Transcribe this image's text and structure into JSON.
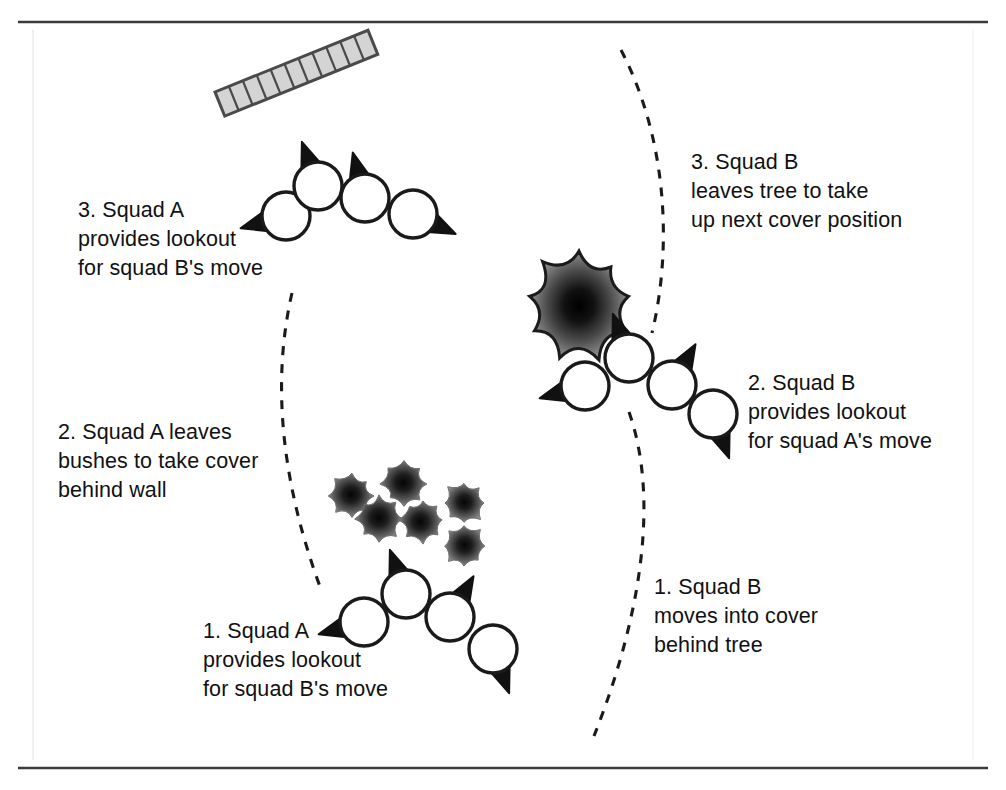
{
  "diagram": {
    "frame": {
      "top_rule": "horizontal-rule",
      "bottom_rule": "horizontal-rule",
      "rule_color": "#3a3a3a"
    },
    "colors": {
      "ink": "#111111",
      "outline": "#1a1a1a",
      "wall_fill": "#d4d4d4",
      "wall_edge": "#4a4a4a",
      "foliage_dark": "#0b0b0b",
      "foliage_mid": "#4f4f4f",
      "foliage_light": "#9a9a9a",
      "soldier_fill": "#ffffff",
      "path_dash": "#1a1a1a",
      "background": "#ffffff"
    },
    "captions": [
      {
        "id": "squad-a-step-3",
        "lines": [
          "3. Squad A",
          "provides lookout",
          "for squad B's move"
        ],
        "x": 78,
        "y": 196
      },
      {
        "id": "squad-a-step-2",
        "lines": [
          "2. Squad A leaves",
          "bushes to take cover",
          "behind wall"
        ],
        "x": 58,
        "y": 418
      },
      {
        "id": "squad-a-step-1",
        "lines": [
          "1. Squad A",
          "provides lookout",
          "for squad B's move"
        ],
        "x": 203,
        "y": 617
      },
      {
        "id": "squad-b-step-3",
        "lines": [
          "3. Squad B",
          "leaves tree to take",
          "up next cover position"
        ],
        "x": 691,
        "y": 148
      },
      {
        "id": "squad-b-step-2",
        "lines": [
          "2. Squad B",
          "provides lookout",
          "for squad A's move"
        ],
        "x": 748,
        "y": 369
      },
      {
        "id": "squad-b-step-1",
        "lines": [
          "1. Squad B",
          "moves into cover",
          "behind tree"
        ],
        "x": 654,
        "y": 573
      }
    ],
    "wall": {
      "id": "brick-wall",
      "label": "wall",
      "x": 215,
      "y": 92,
      "length": 165,
      "thickness": 26,
      "rotation_deg": -22,
      "brick_count": 11
    },
    "tree": {
      "id": "tree",
      "label": "tree",
      "cx": 579,
      "cy": 305,
      "radius": 54
    },
    "bushes": {
      "id": "bush-cluster",
      "label": "bushes",
      "radius": 22,
      "items": [
        {
          "cx": 352,
          "cy": 496
        },
        {
          "cx": 404,
          "cy": 484
        },
        {
          "cx": 379,
          "cy": 519
        },
        {
          "cx": 423,
          "cy": 520
        },
        {
          "cx": 464,
          "cy": 503
        },
        {
          "cx": 464,
          "cy": 546
        }
      ]
    },
    "soldier_groups": [
      {
        "id": "squad-a-upper",
        "squad": "A",
        "soldiers": [
          {
            "cx": 286,
            "cy": 216,
            "r": 24,
            "facing_deg": 255
          },
          {
            "cx": 318,
            "cy": 186,
            "r": 24,
            "facing_deg": 340
          },
          {
            "cx": 365,
            "cy": 198,
            "r": 24,
            "facing_deg": 345
          },
          {
            "cx": 413,
            "cy": 214,
            "r": 24,
            "facing_deg": 115
          }
        ]
      },
      {
        "id": "squad-a-lower",
        "squad": "A",
        "soldiers": [
          {
            "cx": 364,
            "cy": 622,
            "r": 24,
            "facing_deg": 255
          },
          {
            "cx": 406,
            "cy": 594,
            "r": 24,
            "facing_deg": 340
          },
          {
            "cx": 450,
            "cy": 617,
            "r": 24,
            "facing_deg": 30
          },
          {
            "cx": 493,
            "cy": 649,
            "r": 24,
            "facing_deg": 160
          }
        ]
      },
      {
        "id": "squad-b",
        "squad": "B",
        "soldiers": [
          {
            "cx": 585,
            "cy": 386,
            "r": 24,
            "facing_deg": 255
          },
          {
            "cx": 629,
            "cy": 358,
            "r": 24,
            "facing_deg": 340
          },
          {
            "cx": 672,
            "cy": 385,
            "r": 24,
            "facing_deg": 30
          },
          {
            "cx": 713,
            "cy": 414,
            "r": 24,
            "facing_deg": 160
          }
        ]
      }
    ],
    "paths": [
      {
        "id": "squad-a-move-path",
        "label": "squad A movement path",
        "d": "M 292 293 C 272 380 280 480 322 592"
      },
      {
        "id": "squad-b-move-path-upper",
        "label": "squad B movement path upper",
        "d": "M 621 50 C 668 140 672 250 652 333"
      },
      {
        "id": "squad-b-move-path-lower",
        "label": "squad B movement path lower",
        "d": "M 629 412 C 660 500 640 620 594 736"
      }
    ]
  }
}
